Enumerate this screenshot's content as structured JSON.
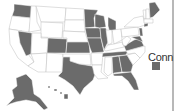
{
  "map": {
    "title": "",
    "colors": {
      "highlighted": "#6b6b6b",
      "other": "#ffffff",
      "border": "#bdbdbd",
      "divider": "#b8b8b8"
    },
    "highlighted_states": [
      "WA",
      "NV",
      "CO",
      "KS",
      "MN",
      "WI",
      "IA",
      "IL",
      "MO",
      "MI",
      "TN",
      "VA",
      "MD",
      "DE",
      "NJ",
      "CT",
      "ME",
      "AL",
      "GA",
      "FL",
      "TX",
      "AK",
      "HI"
    ]
  },
  "legend": {
    "label": "Conn",
    "swatch_color": "#6b6b6b"
  }
}
